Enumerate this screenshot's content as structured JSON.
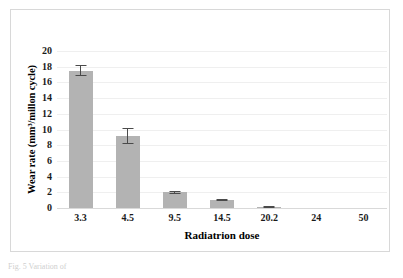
{
  "figure": {
    "background_color": "#ffffff",
    "frame_color": "#d8d8d8",
    "caption_clipped": "Fig. 5 Variation of"
  },
  "chart_data": {
    "type": "bar",
    "title": "",
    "xlabel": "Radiatrion dose",
    "ylabel": "Wear rate (mm³/millon cycle)",
    "categories": [
      "3.3",
      "4.5",
      "9.5",
      "14.5",
      "20.2",
      "24",
      "50"
    ],
    "values": [
      17.5,
      9.2,
      2.0,
      1.0,
      0.1,
      0,
      0
    ],
    "errors": [
      0.7,
      1.0,
      0.2,
      0.12,
      0.1,
      0,
      0
    ],
    "ylim": [
      0,
      20
    ],
    "yticks": [
      "0",
      "2",
      "4",
      "6",
      "8",
      "10",
      "12",
      "14",
      "16",
      "18",
      "20"
    ],
    "ytick_values": [
      0,
      2,
      4,
      6,
      8,
      10,
      12,
      14,
      16,
      18,
      20
    ],
    "grid": true,
    "grid_axis": "y",
    "legend": false,
    "bar_color": "#b3b3b3",
    "error_bar_color": "#4a4a4a",
    "gridline_color": "#efefef",
    "text_color": "#1a1a1a"
  }
}
